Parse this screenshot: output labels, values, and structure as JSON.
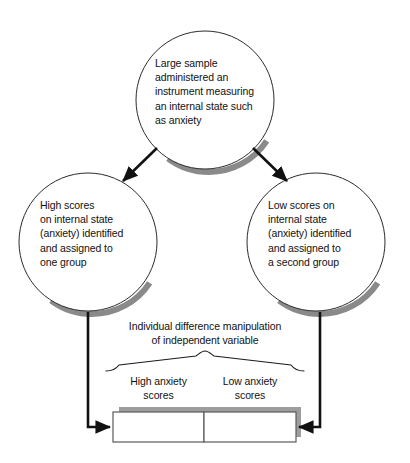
{
  "diagram": {
    "colors": {
      "outline": "#1a1a1a",
      "circle_outline": "#2b2b2b",
      "shadow": "#8a8a8a",
      "box_border": "#4d4d4d",
      "box_fill": "#ffffff",
      "text": "#111111",
      "background": "#ffffff"
    },
    "nodes": [
      {
        "id": "top-circle",
        "name": "sample-circle",
        "shape": "circle",
        "text": "Large sample\nadministered an\ninstrument measuring\nan internal state such\nas anxiety"
      },
      {
        "id": "left-circle",
        "name": "high-scores-circle",
        "shape": "circle",
        "text": "High scores\non internal state\n(anxiety) identified\nand assigned to\none group"
      },
      {
        "id": "right-circle",
        "name": "low-scores-circle",
        "shape": "circle",
        "text": "Low scores on\ninternal state\n(anxiety) identified\nand assigned to\na second group"
      }
    ],
    "manipulation_label": "Individual difference manipulation\nof independent variable",
    "group_labels": [
      {
        "id": "high-anxiety",
        "text": "High anxiety\nscores"
      },
      {
        "id": "low-anxiety",
        "text": "Low anxiety\nscores"
      }
    ],
    "result_boxes": [
      {
        "id": "high-anxiety-box",
        "text": ""
      },
      {
        "id": "low-anxiety-box",
        "text": ""
      }
    ],
    "connectors": [
      {
        "id": "top-to-left",
        "type": "diagonal-arrow",
        "direction": "down-left"
      },
      {
        "id": "top-to-right",
        "type": "diagonal-arrow",
        "direction": "down-right"
      },
      {
        "id": "left-to-box",
        "type": "elbow-arrow",
        "direction": "down-then-right"
      },
      {
        "id": "right-to-box",
        "type": "elbow-arrow",
        "direction": "down-then-left"
      }
    ],
    "brace": {
      "id": "group-brace",
      "type": "horizontal-curly-brace"
    }
  }
}
